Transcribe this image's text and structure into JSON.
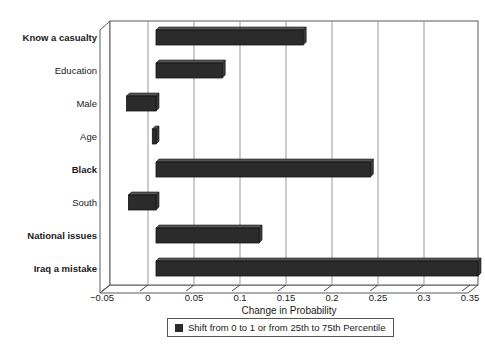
{
  "chart_data": {
    "type": "bar",
    "orientation": "horizontal",
    "title": "",
    "xlabel": "Change in Probability",
    "ylabel": "",
    "xlim": [
      -0.05,
      0.35
    ],
    "xticks": [
      -0.05,
      0,
      0.05,
      0.1,
      0.15,
      0.2,
      0.25,
      0.3,
      0.35
    ],
    "xticklabels": [
      "−0.05",
      "0",
      "0.05",
      "0.1",
      "0.15",
      "0.2",
      "0.25",
      "0.3",
      "0.35"
    ],
    "grid": "vertical",
    "bar_color": "#2b2b2b",
    "categories": [
      "Know a casualty",
      "Education",
      "Male",
      "Age",
      "Black",
      "South",
      "National issues",
      "Iraq a mistake"
    ],
    "values": [
      0.16,
      0.072,
      -0.032,
      -0.004,
      0.233,
      -0.03,
      0.112,
      0.35
    ],
    "bold_categories": [
      "Know a casualty",
      "Black",
      "National issues",
      "Iraq a mistake"
    ],
    "legend": {
      "position": "below-axis",
      "entries": [
        {
          "label": "Shift from 0 to 1 or from 25th to 75th Percentile",
          "color": "#2b2b2b"
        }
      ]
    }
  }
}
